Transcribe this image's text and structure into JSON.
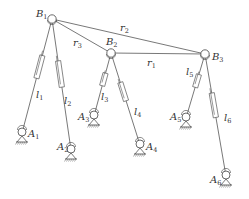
{
  "diagram": {
    "type": "parallel-mechanism-schematic",
    "upper_nodes": [
      {
        "id": "B1",
        "label": "B",
        "sub": "1",
        "x": 52,
        "y": 19,
        "lx": 36,
        "ly": 17
      },
      {
        "id": "B2",
        "label": "B",
        "sub": "2",
        "x": 111,
        "y": 53,
        "lx": 106,
        "ly": 45
      },
      {
        "id": "B3",
        "label": "B",
        "sub": "3",
        "x": 205,
        "y": 54,
        "lx": 212,
        "ly": 60
      }
    ],
    "base_nodes": [
      {
        "id": "A1",
        "label": "A",
        "sub": "1",
        "x": 22,
        "y": 133,
        "lx": 28,
        "ly": 137
      },
      {
        "id": "A2",
        "label": "A",
        "sub": "2",
        "x": 71,
        "y": 150,
        "lx": 57,
        "ly": 150
      },
      {
        "id": "A3",
        "label": "A",
        "sub": "3",
        "x": 94,
        "y": 116,
        "lx": 78,
        "ly": 120
      },
      {
        "id": "A4",
        "label": "A",
        "sub": "4",
        "x": 140,
        "y": 145,
        "lx": 146,
        "ly": 150
      },
      {
        "id": "A5",
        "label": "A",
        "sub": "5",
        "x": 186,
        "y": 118,
        "lx": 170,
        "ly": 120
      },
      {
        "id": "A6",
        "label": "A",
        "sub": "6",
        "x": 226,
        "y": 176,
        "lx": 210,
        "ly": 183
      }
    ],
    "rigid_links": [
      {
        "id": "r1",
        "from": "B2",
        "to": "B3",
        "label": "r",
        "sub": "1",
        "lx": 147,
        "ly": 66
      },
      {
        "id": "r2",
        "from": "B1",
        "to": "B3",
        "label": "r",
        "sub": "2",
        "lx": 120,
        "ly": 31
      },
      {
        "id": "r3",
        "from": "B1",
        "to": "B2",
        "label": "r",
        "sub": "3",
        "lx": 73,
        "ly": 46
      }
    ],
    "legs": [
      {
        "id": "l1",
        "from": "B1",
        "to": "A1",
        "label": "l",
        "sub": "1",
        "lx": 36,
        "ly": 98
      },
      {
        "id": "l2",
        "from": "B1",
        "to": "A2",
        "label": "l",
        "sub": "2",
        "lx": 64,
        "ly": 104
      },
      {
        "id": "l3",
        "from": "B2",
        "to": "A3",
        "label": "l",
        "sub": "3",
        "lx": 101,
        "ly": 100
      },
      {
        "id": "l4",
        "from": "B2",
        "to": "A4",
        "label": "l",
        "sub": "4",
        "lx": 134,
        "ly": 115
      },
      {
        "id": "l5",
        "from": "B3",
        "to": "A5",
        "label": "l",
        "sub": "5",
        "lx": 186,
        "ly": 75
      },
      {
        "id": "l6",
        "from": "B3",
        "to": "A6",
        "label": "l",
        "sub": "6",
        "lx": 224,
        "ly": 121
      }
    ]
  }
}
